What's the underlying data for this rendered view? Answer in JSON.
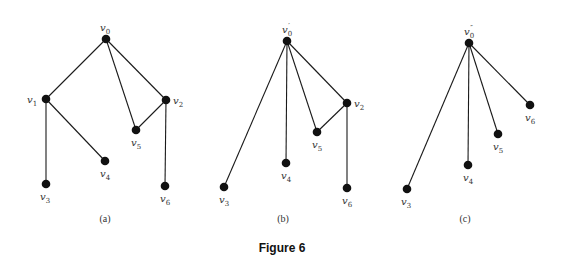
{
  "figure_title": "Figure 6",
  "graphs": [
    {
      "caption": "(a)",
      "nodes": [
        {
          "id": "v0",
          "base": "v",
          "sub": "0",
          "prime": "",
          "x": 106,
          "y": 39,
          "lx": 100,
          "ly": 31
        },
        {
          "id": "v1",
          "base": "v",
          "sub": "1",
          "prime": "",
          "x": 46,
          "y": 99,
          "lx": 27,
          "ly": 103
        },
        {
          "id": "v2",
          "base": "v",
          "sub": "2",
          "prime": "",
          "x": 166,
          "y": 100,
          "lx": 173,
          "ly": 104
        },
        {
          "id": "v5",
          "base": "v",
          "sub": "5",
          "prime": "",
          "x": 136,
          "y": 130,
          "lx": 131,
          "ly": 146
        },
        {
          "id": "v4",
          "base": "v",
          "sub": "4",
          "prime": "",
          "x": 105,
          "y": 161,
          "lx": 100,
          "ly": 177
        },
        {
          "id": "v3",
          "base": "v",
          "sub": "3",
          "prime": "",
          "x": 46,
          "y": 184,
          "lx": 40,
          "ly": 200
        },
        {
          "id": "v6",
          "base": "v",
          "sub": "6",
          "prime": "",
          "x": 165,
          "y": 186,
          "lx": 160,
          "ly": 202
        }
      ],
      "edges": [
        [
          "v0",
          "v1"
        ],
        [
          "v0",
          "v5"
        ],
        [
          "v0",
          "v2"
        ],
        [
          "v2",
          "v5"
        ],
        [
          "v1",
          "v3"
        ],
        [
          "v1",
          "v4"
        ],
        [
          "v2",
          "v6"
        ]
      ],
      "caption_x": 105
    },
    {
      "caption": "(b)",
      "nodes": [
        {
          "id": "v0p",
          "base": "v",
          "sub": "0",
          "prime": "′",
          "x": 287,
          "y": 41,
          "lx": 282,
          "ly": 33
        },
        {
          "id": "v2",
          "base": "v",
          "sub": "2",
          "prime": "",
          "x": 347,
          "y": 103,
          "lx": 354,
          "ly": 107
        },
        {
          "id": "v5",
          "base": "v",
          "sub": "5",
          "prime": "",
          "x": 317,
          "y": 132,
          "lx": 312,
          "ly": 148
        },
        {
          "id": "v4",
          "base": "v",
          "sub": "4",
          "prime": "",
          "x": 286,
          "y": 163,
          "lx": 281,
          "ly": 179
        },
        {
          "id": "v3",
          "base": "v",
          "sub": "3",
          "prime": "",
          "x": 224,
          "y": 187,
          "lx": 219,
          "ly": 203
        },
        {
          "id": "v6",
          "base": "v",
          "sub": "6",
          "prime": "",
          "x": 347,
          "y": 188,
          "lx": 342,
          "ly": 204
        }
      ],
      "edges": [
        [
          "v0p",
          "v3"
        ],
        [
          "v0p",
          "v4"
        ],
        [
          "v0p",
          "v5"
        ],
        [
          "v0p",
          "v2"
        ],
        [
          "v2",
          "v5"
        ],
        [
          "v2",
          "v6"
        ]
      ],
      "caption_x": 283
    },
    {
      "caption": "(c)",
      "nodes": [
        {
          "id": "v0pp",
          "base": "v",
          "sub": "0",
          "prime": "″",
          "x": 469,
          "y": 43,
          "lx": 464,
          "ly": 35
        },
        {
          "id": "v6",
          "base": "v",
          "sub": "6",
          "prime": "",
          "x": 530,
          "y": 105,
          "lx": 525,
          "ly": 121
        },
        {
          "id": "v5",
          "base": "v",
          "sub": "5",
          "prime": "",
          "x": 498,
          "y": 134,
          "lx": 493,
          "ly": 150
        },
        {
          "id": "v4",
          "base": "v",
          "sub": "4",
          "prime": "",
          "x": 468,
          "y": 165,
          "lx": 463,
          "ly": 181
        },
        {
          "id": "v3",
          "base": "v",
          "sub": "3",
          "prime": "",
          "x": 407,
          "y": 189,
          "lx": 401,
          "ly": 205
        }
      ],
      "edges": [
        [
          "v0pp",
          "v3"
        ],
        [
          "v0pp",
          "v4"
        ],
        [
          "v0pp",
          "v5"
        ],
        [
          "v0pp",
          "v6"
        ]
      ],
      "caption_x": 465
    }
  ],
  "caption_y": 222,
  "figure_title_pos": {
    "x": 282,
    "y": 252
  },
  "colors": {
    "edge": "#1a1a1a",
    "node": "#111111",
    "text": "#333333",
    "background": "#ffffff"
  }
}
